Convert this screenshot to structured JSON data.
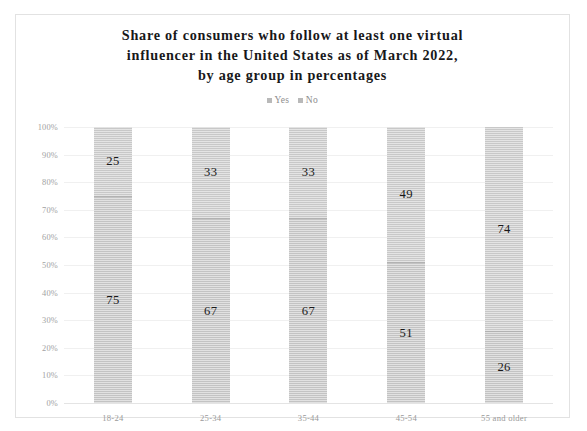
{
  "chart_data": {
    "type": "bar",
    "variant": "stacked-100-percent",
    "title": "Share of consumers who follow at least one virtual influencer in the United States as of March 2022, by age group in percentages",
    "title_lines": [
      "Share of consumers who follow at least one virtual",
      "influencer in the United States as of March 2022,",
      "by age group in percentages"
    ],
    "xlabel": "",
    "ylabel": "",
    "ylim": [
      0,
      100
    ],
    "grid": true,
    "legend_position": "top",
    "categories": [
      "18-24",
      "25-34",
      "35-44",
      "45-54",
      "55 and older"
    ],
    "ytick_labels": [
      "100%",
      "90%",
      "80%",
      "70%",
      "60%",
      "50%",
      "40%",
      "30%",
      "20%",
      "10%",
      "0%"
    ],
    "ytick_values": [
      100,
      90,
      80,
      70,
      60,
      50,
      40,
      30,
      20,
      10,
      0
    ],
    "series": [
      {
        "name": "Yes",
        "color": "#c3c3c3",
        "values": [
          75,
          67,
          67,
          51,
          26
        ]
      },
      {
        "name": "No",
        "color": "#c8c8c8",
        "values": [
          25,
          33,
          33,
          49,
          74
        ]
      }
    ]
  },
  "legend": {
    "items": [
      {
        "label": "Yes",
        "color": "#b9b9b9"
      },
      {
        "label": "No",
        "color": "#b9b9b9"
      }
    ]
  }
}
